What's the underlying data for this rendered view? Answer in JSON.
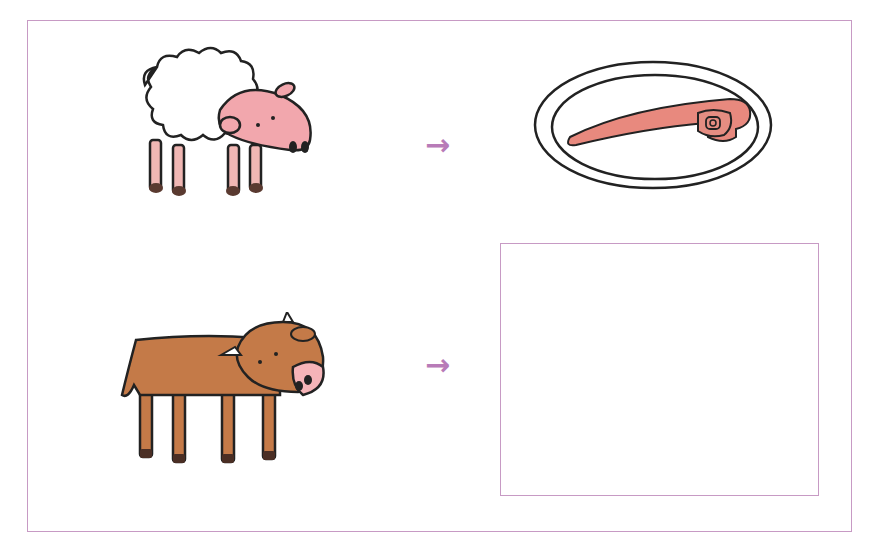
{
  "worksheet": {
    "rows": [
      {
        "animal": "sheep",
        "arrow": "→",
        "product": "lamb chop on plate"
      },
      {
        "animal": "cow",
        "arrow": "→",
        "product": ""
      }
    ],
    "colors": {
      "frame": "#c79ac4",
      "arrow": "#b87bb8",
      "sheep_skin": "#f2a7ad",
      "cow_body": "#c47a48",
      "meat": "#e8897e",
      "outline": "#222222"
    }
  }
}
